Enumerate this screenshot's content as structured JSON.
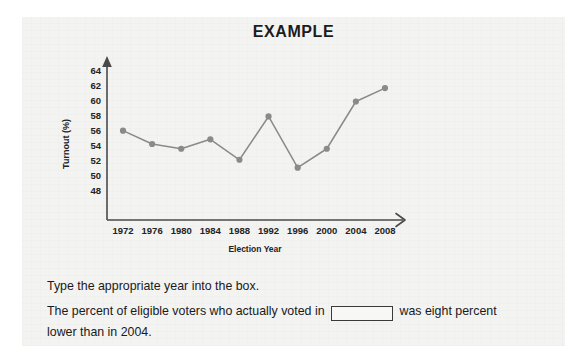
{
  "title": "EXAMPLE",
  "chart_data": {
    "type": "line",
    "title": "EXAMPLE",
    "xlabel": "Election Year",
    "ylabel": "Turnout (%)",
    "categories": [
      "1972",
      "1976",
      "1980",
      "1984",
      "1988",
      "1992",
      "1996",
      "2000",
      "2004",
      "2008"
    ],
    "values": [
      56.3,
      54.6,
      54.0,
      55.2,
      52.6,
      58.1,
      51.6,
      54.0,
      60.0,
      61.7
    ],
    "yticks": [
      48,
      50,
      52,
      54,
      56,
      58,
      60,
      62,
      64
    ],
    "ylim": [
      46.5,
      65.5
    ],
    "grid": false,
    "legend": "none",
    "series_color": "#8a8a8a",
    "marker": "circle",
    "axis_color": "#4a4a4a"
  },
  "question": {
    "instruction": "Type the appropriate year into the box.",
    "body_before": "The percent of eligible voters who actually voted in",
    "body_after": "was eight percent lower than in 2004.",
    "answer_value": "",
    "answer_placeholder": ""
  }
}
